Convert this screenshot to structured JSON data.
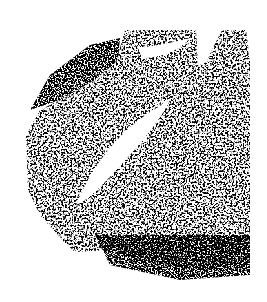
{
  "image": {
    "width": 267,
    "height": 302,
    "background": "#ffffff",
    "ink": "#000000",
    "description": "Abstract black stippled texture with white diagonal voids"
  }
}
